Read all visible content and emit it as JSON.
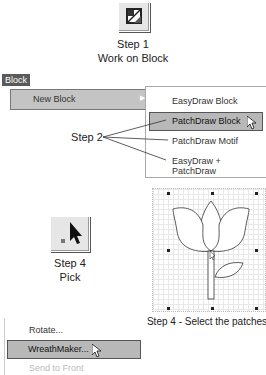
{
  "step1": {
    "title": "Step 1",
    "subtitle": "Work on Block",
    "icon": "block-tool-icon"
  },
  "block_menu": {
    "title": "Block",
    "items": [
      {
        "label": "New Block",
        "mnemonic": "N",
        "has_submenu": true
      }
    ]
  },
  "submenu": {
    "items": [
      {
        "label": "EasyDraw Block",
        "highlighted": false
      },
      {
        "label": "PatchDraw Block",
        "highlighted": true
      },
      {
        "label": "PatchDraw Motif",
        "highlighted": false
      },
      {
        "label": "EasyDraw + PatchDraw",
        "highlighted": false
      }
    ]
  },
  "step2": {
    "label": "Step 2"
  },
  "step4_pick": {
    "title": "Step 4",
    "subtitle": "Pick",
    "icon": "pick-arrow-icon"
  },
  "step4_select": {
    "caption": "Step 4 - Select the patches"
  },
  "context_menu": {
    "items": [
      {
        "label": "Rotate...",
        "highlighted": false,
        "disabled": false
      },
      {
        "label": "WreathMaker...",
        "highlighted": true,
        "disabled": false
      },
      {
        "label": "Send to Front",
        "highlighted": false,
        "disabled": true
      }
    ]
  }
}
